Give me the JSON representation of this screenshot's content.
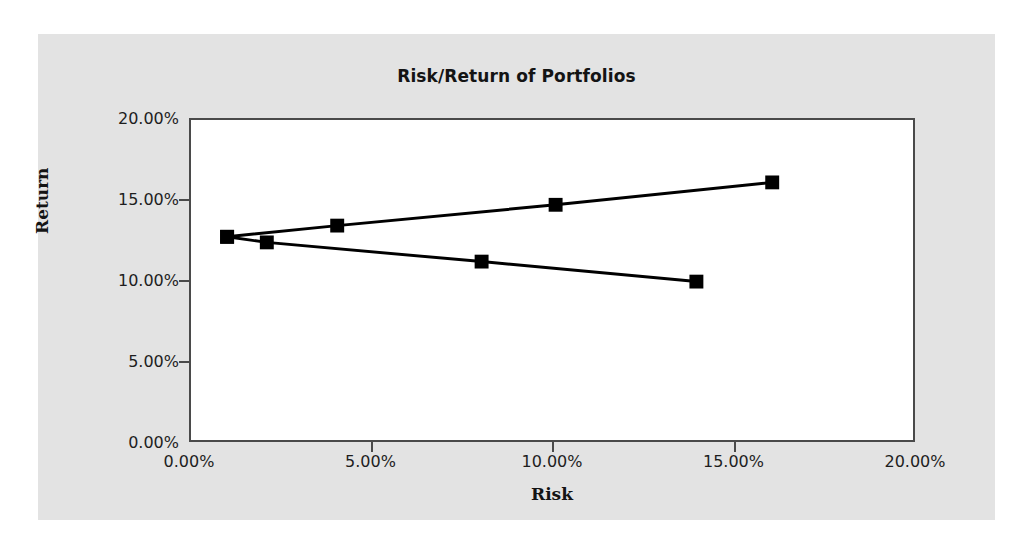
{
  "chart_data": {
    "type": "line",
    "title": "Risk/Return of Portfolios",
    "xlabel": "Risk",
    "ylabel": "Return",
    "xlim": [
      0,
      20
    ],
    "ylim": [
      0,
      20
    ],
    "xticks": [
      "0.00%",
      "5.00%",
      "10.00%",
      "15.00%",
      "20.00%"
    ],
    "xtick_values": [
      0,
      5,
      10,
      15,
      20
    ],
    "yticks": [
      "0.00%",
      "5.00%",
      "10.00%",
      "15.00%",
      "20.00%"
    ],
    "ytick_values": [
      0,
      5,
      10,
      15,
      20
    ],
    "grid": false,
    "legend": "none",
    "marker": "square",
    "marker_color": "#000000",
    "line_color": "#000000",
    "series": [
      {
        "name": "Efficient frontier (upper)",
        "points": [
          {
            "x": 1.0,
            "y": 12.7
          },
          {
            "x": 4.05,
            "y": 13.4
          },
          {
            "x": 10.1,
            "y": 14.7
          },
          {
            "x": 16.1,
            "y": 16.1
          }
        ]
      },
      {
        "name": "Inefficient frontier (lower)",
        "points": [
          {
            "x": 1.0,
            "y": 12.7
          },
          {
            "x": 2.1,
            "y": 12.35
          },
          {
            "x": 8.05,
            "y": 11.15
          },
          {
            "x": 14.0,
            "y": 9.9
          }
        ]
      }
    ]
  },
  "panel": {
    "background_color": "#e3e3e3",
    "plot_background_color": "#ffffff",
    "axis_color": "#4a4a4a"
  }
}
